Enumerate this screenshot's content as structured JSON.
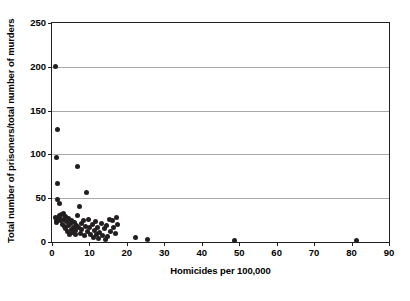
{
  "chart_data": {
    "type": "scatter",
    "title": "",
    "xlabel": "Homicides per 100,000",
    "ylabel": "Total number of prisoners/total number of murders",
    "xlim": [
      0,
      90
    ],
    "ylim": [
      0,
      250
    ],
    "xticks": [
      0,
      10,
      20,
      30,
      40,
      50,
      60,
      70,
      80,
      90
    ],
    "yticks": [
      0,
      50,
      100,
      150,
      200,
      250
    ],
    "grid": "horizontal",
    "gridlines_y": [
      50,
      100,
      150,
      200
    ],
    "legend": "none",
    "marker": {
      "shape": "circle",
      "color": "#231f20",
      "size_px": 5
    },
    "points": [
      [
        0.9,
        200
      ],
      [
        1.6,
        128
      ],
      [
        1.1,
        97
      ],
      [
        1.4,
        67
      ],
      [
        1.5,
        48
      ],
      [
        2.0,
        44
      ],
      [
        6.7,
        86
      ],
      [
        9.2,
        56
      ],
      [
        7.3,
        41
      ],
      [
        1.0,
        28
      ],
      [
        1.3,
        25
      ],
      [
        1.2,
        22
      ],
      [
        1.9,
        30
      ],
      [
        2.1,
        27
      ],
      [
        2.3,
        24
      ],
      [
        2.6,
        31
      ],
      [
        2.8,
        20
      ],
      [
        3.0,
        33
      ],
      [
        3.2,
        26
      ],
      [
        3.4,
        18
      ],
      [
        3.5,
        29
      ],
      [
        3.7,
        15
      ],
      [
        3.9,
        23
      ],
      [
        4.1,
        12
      ],
      [
        4.3,
        27
      ],
      [
        4.5,
        19
      ],
      [
        4.7,
        9
      ],
      [
        4.9,
        21
      ],
      [
        5.1,
        14
      ],
      [
        5.3,
        25
      ],
      [
        5.6,
        11
      ],
      [
        5.8,
        17
      ],
      [
        6.0,
        22
      ],
      [
        6.2,
        8
      ],
      [
        6.4,
        13
      ],
      [
        6.6,
        19
      ],
      [
        6.9,
        30
      ],
      [
        7.1,
        16
      ],
      [
        7.6,
        10
      ],
      [
        7.8,
        21
      ],
      [
        8.0,
        14
      ],
      [
        8.3,
        24
      ],
      [
        8.6,
        7
      ],
      [
        8.9,
        18
      ],
      [
        9.5,
        12
      ],
      [
        9.8,
        26
      ],
      [
        10.1,
        16
      ],
      [
        10.4,
        9
      ],
      [
        10.7,
        20
      ],
      [
        11.0,
        5
      ],
      [
        11.3,
        13
      ],
      [
        11.6,
        23
      ],
      [
        11.9,
        8
      ],
      [
        12.2,
        17
      ],
      [
        12.5,
        4
      ],
      [
        12.8,
        11
      ],
      [
        13.1,
        21
      ],
      [
        13.5,
        7
      ],
      [
        13.9,
        15
      ],
      [
        14.2,
        3
      ],
      [
        14.5,
        19
      ],
      [
        14.9,
        6
      ],
      [
        15.3,
        26
      ],
      [
        15.7,
        12
      ],
      [
        16.1,
        24
      ],
      [
        16.5,
        17
      ],
      [
        16.9,
        10
      ],
      [
        17.3,
        28
      ],
      [
        17.6,
        20
      ],
      [
        22.2,
        5
      ],
      [
        25.4,
        3
      ],
      [
        48.8,
        2
      ],
      [
        81.2,
        2
      ]
    ]
  }
}
